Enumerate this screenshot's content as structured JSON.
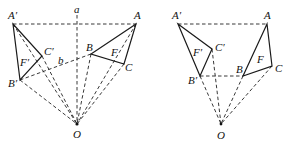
{
  "figures": [
    {
      "id": "left",
      "points": {
        "A1": {
          "label": "A′",
          "x": 13,
          "y": 24,
          "lx": 8,
          "ly": 19
        },
        "A": {
          "label": "A",
          "x": 136,
          "y": 24,
          "lx": 136,
          "ly": 19
        },
        "a": {
          "label": "a",
          "x": 77,
          "y": 15,
          "lx": 74,
          "ly": 13
        },
        "C1": {
          "label": "C′",
          "x": 42,
          "y": 56,
          "lx": 44,
          "ly": 55
        },
        "B": {
          "label": "B",
          "x": 91,
          "y": 54,
          "lx": 86,
          "ly": 52
        },
        "C": {
          "label": "C",
          "x": 124,
          "y": 64,
          "lx": 125,
          "ly": 70
        },
        "B1": {
          "label": "B′",
          "x": 20,
          "y": 80,
          "lx": 9,
          "ly": 87
        },
        "O": {
          "label": "O",
          "x": 77,
          "y": 124,
          "lx": 73,
          "ly": 137
        },
        "b": {
          "label": "b",
          "lx": 58,
          "ly": 64
        }
      },
      "region_labels": {
        "F1": {
          "label": "F′",
          "lx": 20,
          "ly": 65
        },
        "F": {
          "label": "F",
          "lx": 112,
          "ly": 55
        }
      }
    },
    {
      "id": "right",
      "points": {
        "A1": {
          "label": "A′",
          "x": 178,
          "y": 24,
          "lx": 172,
          "ly": 19
        },
        "A": {
          "label": "A",
          "x": 267,
          "y": 24,
          "lx": 265,
          "ly": 19
        },
        "C1": {
          "label": "C′",
          "x": 212,
          "y": 49,
          "lx": 215,
          "ly": 50
        },
        "B1": {
          "label": "B′",
          "x": 200,
          "y": 76,
          "lx": 188,
          "ly": 84
        },
        "B": {
          "label": "B",
          "x": 243,
          "y": 76,
          "lx": 236,
          "ly": 73
        },
        "C": {
          "label": "C",
          "x": 272,
          "y": 66,
          "lx": 275,
          "ly": 72
        },
        "O": {
          "label": "O",
          "x": 221,
          "y": 124,
          "lx": 217,
          "ly": 139
        }
      },
      "region_labels": {
        "F1": {
          "label": "F′",
          "lx": 194,
          "ly": 55
        },
        "F": {
          "label": "F",
          "lx": 258,
          "ly": 62
        }
      }
    }
  ]
}
